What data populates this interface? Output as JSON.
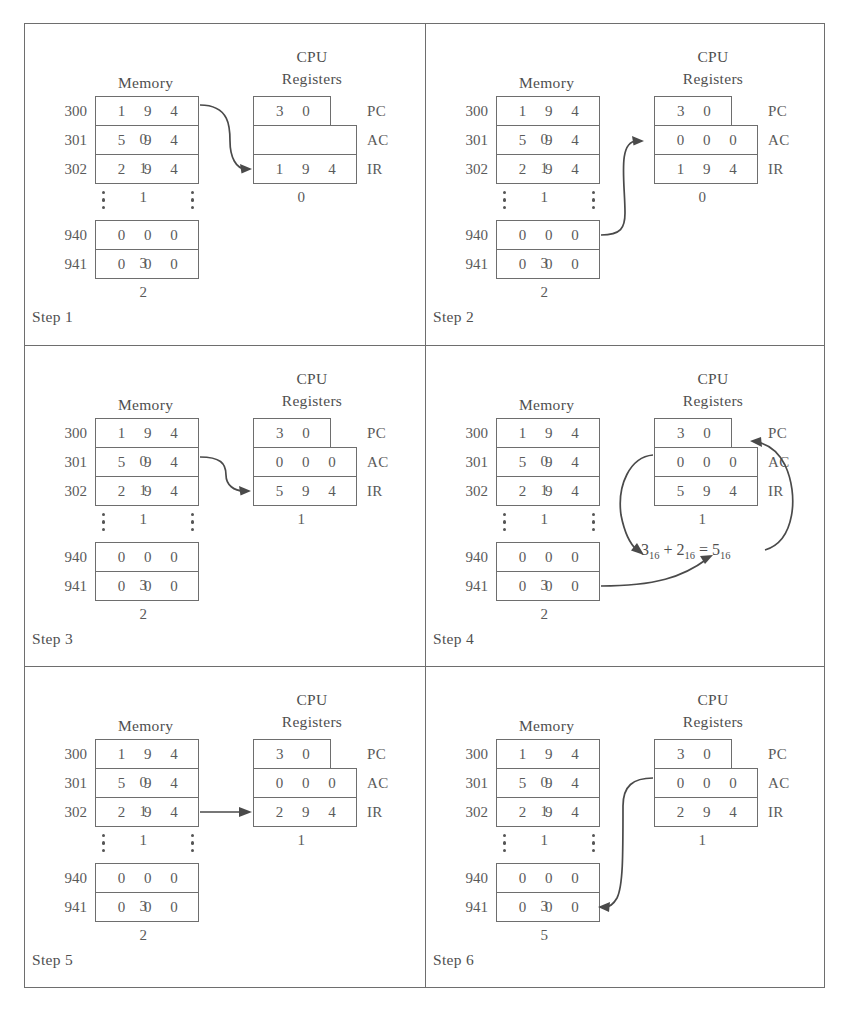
{
  "figure": {
    "headings": {
      "memory": "Memory",
      "cpu": "CPU",
      "registers": "Registers"
    },
    "register_labels": {
      "pc": "PC",
      "ac": "AC",
      "ir": "IR"
    },
    "memory_addresses": [
      "300",
      "301",
      "302",
      "940",
      "941"
    ],
    "colors": {
      "ink": "#4a4a4a",
      "box_border": "#6e6e6e",
      "background": "#ffffff",
      "arrow": "#4a4a4a"
    }
  },
  "steps": [
    {
      "caption": "Step 1",
      "memory": {
        "300": "1 9 4 0",
        "301": "5 9 4 1",
        "302": "2 9 4 1",
        "940": "0 0 0 3",
        "941": "0 0 0 2"
      },
      "registers": {
        "pc": "3 0 0",
        "ac": "",
        "ir": "1 9 4 0"
      },
      "arrow": "memory-300-to-ir",
      "note": ""
    },
    {
      "caption": "Step 2",
      "memory": {
        "300": "1 9 4 0",
        "301": "5 9 4 1",
        "302": "2 9 4 1",
        "940": "0 0 0 3",
        "941": "0 0 0 2"
      },
      "registers": {
        "pc": "3 0 0",
        "ac": "0 0 0 3",
        "ir": "1 9 4 0"
      },
      "arrow": "memory-940-to-ac",
      "note": ""
    },
    {
      "caption": "Step 3",
      "memory": {
        "300": "1 9 4 0",
        "301": "5 9 4 1",
        "302": "2 9 4 1",
        "940": "0 0 0 3",
        "941": "0 0 0 2"
      },
      "registers": {
        "pc": "3 0 1",
        "ac": "0 0 0 3",
        "ir": "5 9 4 1"
      },
      "arrow": "memory-301-to-ir",
      "note": ""
    },
    {
      "caption": "Step 4",
      "memory": {
        "300": "1 9 4 0",
        "301": "5 9 4 1",
        "302": "2 9 4 1",
        "940": "0 0 0 3",
        "941": "0 0 0 2"
      },
      "registers": {
        "pc": "3 0 1",
        "ac": "0 0 0 5",
        "ir": "5 9 4 1"
      },
      "arrow": "alu-add",
      "note": {
        "a": "3",
        "a_sub": "16",
        "op": "+",
        "b": "2",
        "b_sub": "16",
        "eq": "=",
        "c": "5",
        "c_sub": "16"
      }
    },
    {
      "caption": "Step 5",
      "memory": {
        "300": "1 9 4 0",
        "301": "5 9 4 1",
        "302": "2 9 4 1",
        "940": "0 0 0 3",
        "941": "0 0 0 2"
      },
      "registers": {
        "pc": "3 0 2",
        "ac": "0 0 0 5",
        "ir": "2 9 4 1"
      },
      "arrow": "memory-302-to-ir-straight",
      "note": ""
    },
    {
      "caption": "Step 6",
      "memory": {
        "300": "1 9 4 0",
        "301": "5 9 4 1",
        "302": "2 9 4 1",
        "940": "0 0 0 3",
        "941": "0 0 0 5"
      },
      "registers": {
        "pc": "3 0 2",
        "ac": "0 0 0 5",
        "ir": "2 9 4 1"
      },
      "arrow": "ac-to-memory-941",
      "note": ""
    }
  ]
}
